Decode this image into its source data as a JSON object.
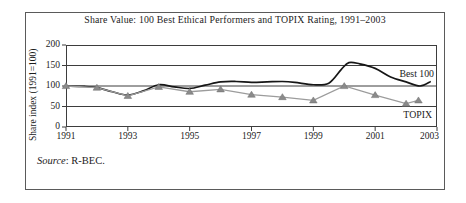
{
  "source": {
    "prefix": "Source",
    "rest": ": R-BEC."
  },
  "chart_data": {
    "type": "line",
    "title": "Share Value: 100 Best Ethical Performers and TOPIX Rating, 1991–2003",
    "xlabel": "",
    "ylabel": "Share index (1991=100)",
    "xlim": [
      1991,
      2003
    ],
    "ylim": [
      0,
      200
    ],
    "x_ticks": [
      1991,
      1993,
      1995,
      1997,
      1999,
      2001,
      2003
    ],
    "y_ticks": [
      0,
      50,
      100,
      150,
      200
    ],
    "grid": "horizontal",
    "legend_position": "inline-right",
    "frame_color": "#3d3d3d",
    "text_color": "#1c1c1c",
    "series": [
      {
        "name": "Best 100",
        "color": "#161616",
        "width": 1.7,
        "smooth": true,
        "marker": "none",
        "x": [
          1991,
          1991.6,
          1992,
          1992.5,
          1993,
          1993.5,
          1994,
          1994.5,
          1995,
          1995.5,
          1996,
          1996.5,
          1997,
          1997.5,
          1998,
          1998.4,
          1999,
          1999.5,
          1999.9,
          2000.15,
          2000.5,
          2001,
          2001.5,
          2002,
          2002.45,
          2002.8
        ],
        "values": [
          100,
          99,
          96,
          86,
          78,
          88,
          103,
          98,
          94,
          102,
          110,
          111,
          109,
          110,
          111,
          109,
          103,
          107,
          140,
          157,
          154,
          143,
          122,
          110,
          100,
          111
        ]
      },
      {
        "name": "TOPIX",
        "color": "#9c9c9c",
        "width": 1.3,
        "smooth": false,
        "marker": "triangle",
        "marker_fill": "#8a8a8a",
        "marker_edge": "#6e6e6e",
        "x": [
          1991,
          1992,
          1993,
          1994,
          1995,
          1996,
          1997,
          1998,
          1999,
          2000,
          2001,
          2002,
          2002.4
        ],
        "values": [
          100,
          96,
          76,
          98,
          86,
          92,
          79,
          73,
          65,
          100,
          78,
          57,
          65
        ]
      }
    ]
  }
}
